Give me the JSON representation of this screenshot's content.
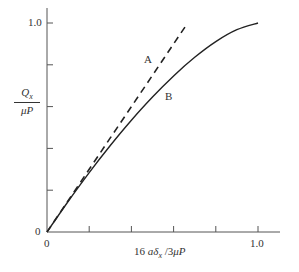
{
  "chart_data": {
    "type": "line",
    "title": "",
    "xlabel": "16 aδx / 3μP",
    "ylabel": "Qx / μP",
    "xlim": [
      0,
      1.0
    ],
    "ylim": [
      0,
      1.0
    ],
    "x_ticks": [
      0,
      0.2,
      0.4,
      0.6,
      0.8,
      1.0
    ],
    "x_tick_labels": [
      "0",
      "",
      "",
      "",
      "",
      "1.0"
    ],
    "y_ticks": [
      0,
      0.2,
      0.4,
      0.6,
      0.8,
      1.0
    ],
    "y_tick_labels": [
      "0",
      "",
      "",
      "",
      "",
      "1.0"
    ],
    "grid": false,
    "legend": "none",
    "series": [
      {
        "name": "A",
        "style": "dashed",
        "x": [
          0,
          0.1,
          0.2,
          0.3,
          0.4,
          0.5,
          0.6,
          0.667
        ],
        "y": [
          0,
          0.15,
          0.3,
          0.45,
          0.6,
          0.75,
          0.9,
          1.0
        ]
      },
      {
        "name": "B",
        "style": "solid",
        "x": [
          0,
          0.1,
          0.2,
          0.3,
          0.4,
          0.5,
          0.6,
          0.7,
          0.8,
          0.9,
          1.0
        ],
        "y": [
          0,
          0.146,
          0.284,
          0.414,
          0.535,
          0.646,
          0.747,
          0.836,
          0.911,
          0.968,
          1.0
        ]
      }
    ],
    "annotations": [
      {
        "text": "A",
        "x": 0.48,
        "y": 0.82
      },
      {
        "text": "B",
        "x": 0.58,
        "y": 0.65
      }
    ]
  },
  "labels": {
    "y_num": "Q",
    "y_num_sub": "x",
    "y_den": "μP",
    "x_prefix": "16 ",
    "x_a": "a",
    "x_delta": "δ",
    "x_sub": "x",
    "x_suffix": " /3",
    "x_mu": "μP",
    "tick_x0": "0",
    "tick_x1": "1.0",
    "tick_y0": "0",
    "tick_y1": "1.0",
    "ann_a": "A",
    "ann_b": "B"
  }
}
